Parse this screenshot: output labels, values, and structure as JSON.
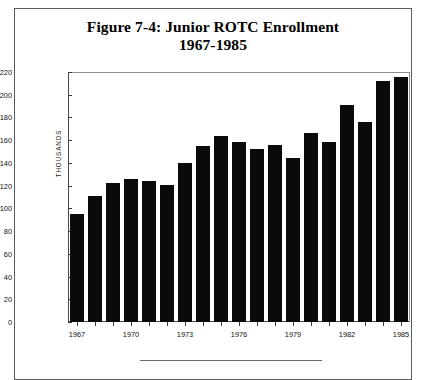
{
  "figure": {
    "title_line1": "Figure 7-4: Junior ROTC Enrollment",
    "title_line2": "1967-1985"
  },
  "chart_data": {
    "type": "bar",
    "title": "Figure 7-4: Junior ROTC Enrollment 1967-1985",
    "xlabel": "",
    "ylabel": "THOUSANDS",
    "ylim": [
      0,
      220
    ],
    "ytick_step": 20,
    "yticks": [
      0,
      20,
      40,
      60,
      80,
      100,
      120,
      140,
      160,
      180,
      200,
      220
    ],
    "ytick_labels": [
      "0",
      "20",
      "40",
      "60",
      "80",
      "100",
      "120",
      "140",
      "160",
      "180",
      "200",
      "220"
    ],
    "grid": false,
    "legend": null,
    "bar_color": "#0a0a0a",
    "categories": [
      "1967",
      "1968",
      "1969",
      "1970",
      "1971",
      "1972",
      "1973",
      "1974",
      "1975",
      "1976",
      "1977",
      "1978",
      "1979",
      "1980",
      "1981",
      "1982",
      "1983",
      "1984",
      "1985"
    ],
    "xtick_labels": [
      "1967",
      "1970",
      "1973",
      "1976",
      "1979",
      "1982",
      "1985"
    ],
    "values": [
      95,
      111,
      122,
      126,
      124,
      121,
      140,
      155,
      164,
      158,
      152,
      156,
      144,
      166,
      158,
      191,
      176,
      212,
      216
    ],
    "units": "thousands"
  }
}
